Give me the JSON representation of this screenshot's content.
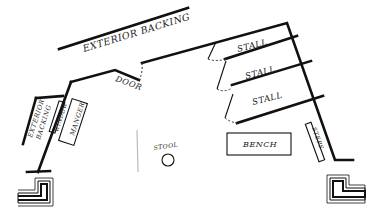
{
  "diagram": {
    "type": "floor-plan",
    "labels": {
      "exterior_backing_top": "EXTERIOR BACKING",
      "exterior_backing_left_line1": "EXTERIOR",
      "exterior_backing_left_line2": "BACKING",
      "door": "DOOR",
      "window": "WINDOW",
      "manger": "MANGER",
      "stall_1": "STALL",
      "stall_2": "STALL",
      "stall_3": "STALL",
      "stool": "STOOL",
      "bench": "BENCH",
      "steps": "STEPS"
    },
    "colors": {
      "ink": "#111111",
      "background": "#ffffff"
    }
  }
}
